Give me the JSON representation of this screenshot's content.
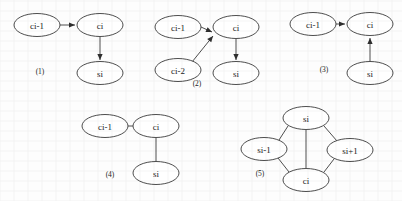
{
  "figure": {
    "background_color": "#fdfdfd",
    "stroke_color": "#3a3a3a",
    "node_fill": "#ffffff",
    "text_color": "#1c1c1c",
    "node_rx": 23,
    "node_ry": 11.5
  },
  "diagrams": [
    {
      "id": "diagram-1",
      "caption": "(1)",
      "caption_x": 40,
      "caption_y": 71,
      "nodes": [
        {
          "name": "node-ci-minus-1",
          "label": "ci-1",
          "x": 37,
          "y": 25,
          "rx": 23,
          "ry": 11.5
        },
        {
          "name": "node-ci",
          "label": "ci",
          "x": 100,
          "y": 25,
          "rx": 23,
          "ry": 11.5
        },
        {
          "name": "node-si",
          "label": "si",
          "x": 100,
          "y": 73,
          "rx": 23,
          "ry": 11.5
        }
      ],
      "edges": [
        {
          "name": "edge-ci-minus-1-to-ci",
          "from": "ci-1",
          "to": "ci",
          "x1": 60,
          "y1": 25,
          "x2": 75,
          "y2": 25,
          "directed": true
        },
        {
          "name": "edge-ci-to-si",
          "from": "ci",
          "to": "si",
          "x1": 100,
          "y1": 37,
          "x2": 100,
          "y2": 60,
          "directed": true
        }
      ]
    },
    {
      "id": "diagram-2",
      "caption": "(2)",
      "caption_x": 197,
      "caption_y": 83,
      "nodes": [
        {
          "name": "node-ci-minus-1",
          "label": "ci-1",
          "x": 178,
          "y": 27,
          "rx": 23,
          "ry": 11.5
        },
        {
          "name": "node-ci-minus-2",
          "label": "ci-2",
          "x": 178,
          "y": 70,
          "rx": 23,
          "ry": 11.5
        },
        {
          "name": "node-ci",
          "label": "ci",
          "x": 236,
          "y": 27,
          "rx": 23,
          "ry": 11.5
        },
        {
          "name": "node-si",
          "label": "si",
          "x": 236,
          "y": 73,
          "rx": 23,
          "ry": 11.5
        }
      ],
      "edges": [
        {
          "name": "edge-ci-minus-1-to-ci",
          "from": "ci-1",
          "to": "ci",
          "x1": 201,
          "y1": 27,
          "x2": 212,
          "y2": 32,
          "directed": true
        },
        {
          "name": "edge-ci-minus-2-to-ci",
          "from": "ci-2",
          "to": "ci",
          "x1": 192,
          "y1": 62,
          "x2": 213,
          "y2": 36,
          "directed": true
        },
        {
          "name": "edge-ci-to-si",
          "from": "ci",
          "to": "si",
          "x1": 236,
          "y1": 39,
          "x2": 236,
          "y2": 60,
          "directed": true
        }
      ]
    },
    {
      "id": "diagram-3",
      "caption": "(3)",
      "caption_x": 324,
      "caption_y": 69,
      "nodes": [
        {
          "name": "node-ci-minus-1",
          "label": "ci-1",
          "x": 313,
          "y": 24,
          "rx": 23,
          "ry": 11.5
        },
        {
          "name": "node-ci",
          "label": "ci",
          "x": 370,
          "y": 24,
          "rx": 23,
          "ry": 11.5
        },
        {
          "name": "node-si",
          "label": "si",
          "x": 370,
          "y": 73,
          "rx": 23,
          "ry": 11.5
        }
      ],
      "edges": [
        {
          "name": "edge-ci-minus-1-to-ci",
          "from": "ci-1",
          "to": "ci",
          "x1": 336,
          "y1": 24,
          "x2": 345,
          "y2": 24,
          "directed": true
        },
        {
          "name": "edge-si-to-ci",
          "from": "si",
          "to": "ci",
          "x1": 370,
          "y1": 61,
          "x2": 370,
          "y2": 38,
          "directed": true
        }
      ]
    },
    {
      "id": "diagram-4",
      "caption": "(4)",
      "caption_x": 110,
      "caption_y": 174,
      "nodes": [
        {
          "name": "node-ci-minus-1",
          "label": "ci-1",
          "x": 105,
          "y": 126,
          "rx": 23,
          "ry": 11.5
        },
        {
          "name": "node-ci",
          "label": "ci",
          "x": 156,
          "y": 126,
          "rx": 23,
          "ry": 11.5
        },
        {
          "name": "node-si",
          "label": "si",
          "x": 156,
          "y": 173,
          "rx": 23,
          "ry": 11.5
        }
      ],
      "edges": [
        {
          "name": "edge-ci-minus-1-ci",
          "from": "ci-1",
          "to": "ci",
          "x1": 128,
          "y1": 126,
          "x2": 133,
          "y2": 126,
          "directed": false
        },
        {
          "name": "edge-ci-si",
          "from": "ci",
          "to": "si",
          "x1": 156,
          "y1": 138,
          "x2": 156,
          "y2": 161,
          "directed": false
        }
      ]
    },
    {
      "id": "diagram-5",
      "caption": "(5)",
      "caption_x": 260,
      "caption_y": 173,
      "nodes": [
        {
          "name": "node-si",
          "label": "si",
          "x": 306,
          "y": 118,
          "rx": 23,
          "ry": 11.5
        },
        {
          "name": "node-si-minus-1",
          "label": "si-1",
          "x": 264,
          "y": 149,
          "rx": 23,
          "ry": 11.5
        },
        {
          "name": "node-si-plus-1",
          "label": "si+1",
          "x": 350,
          "y": 150,
          "rx": 23,
          "ry": 11.5
        },
        {
          "name": "node-ci",
          "label": "ci",
          "x": 306,
          "y": 180,
          "rx": 23,
          "ry": 11.5
        }
      ],
      "edges": [
        {
          "name": "edge-si-si-minus-1",
          "from": "si",
          "to": "si-1",
          "x1": 288,
          "y1": 126,
          "x2": 279,
          "y2": 140,
          "directed": false
        },
        {
          "name": "edge-si-si-plus-1",
          "from": "si",
          "to": "si+1",
          "x1": 324,
          "y1": 126,
          "x2": 337,
          "y2": 141,
          "directed": false
        },
        {
          "name": "edge-si-ci",
          "from": "si",
          "to": "ci",
          "x1": 306,
          "y1": 130,
          "x2": 306,
          "y2": 168,
          "directed": false
        },
        {
          "name": "edge-si-minus-1-ci",
          "from": "si-1",
          "to": "ci",
          "x1": 278,
          "y1": 158,
          "x2": 289,
          "y2": 172,
          "directed": false
        },
        {
          "name": "edge-si-plus-1-ci",
          "from": "si+1",
          "to": "ci",
          "x1": 334,
          "y1": 159,
          "x2": 324,
          "y2": 172,
          "directed": false
        }
      ]
    }
  ]
}
